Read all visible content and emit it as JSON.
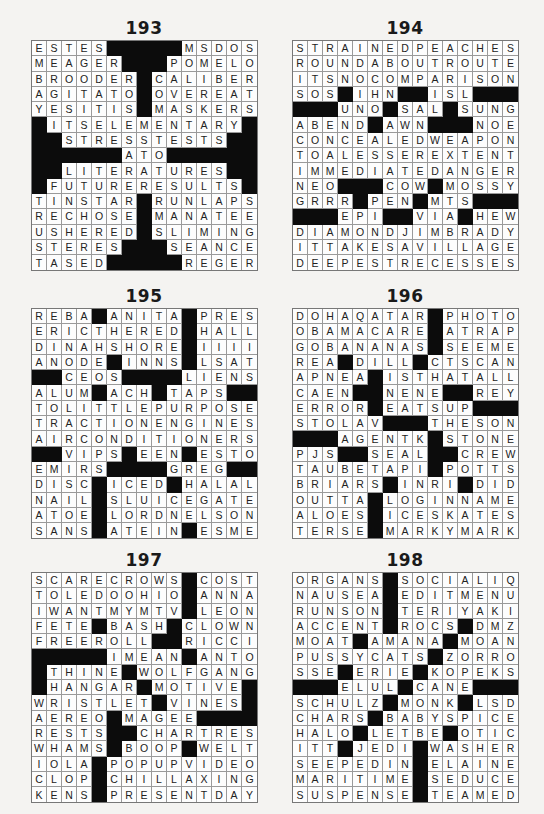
{
  "puzzles": [
    {
      "id": "p193",
      "title": "193",
      "rows": [
        "ESTES#####MSDOS",
        "MEAGER###POMELO",
        "BROODER#CALIBER",
        "AGITATO#OVEREAT",
        "YESITIS#MASKERS",
        "#ITSELEMENTARY#",
        "##STRESSTESTS##",
        "######ATO######",
        "##LITERATURES##",
        "#FUTURERESULTS#",
        "TINSTAR#RUNLAPS",
        "RECHOSE#MANATEE",
        "USHERED#SLIMING",
        "STERES###SEANCE",
        "TASED#####REGER"
      ]
    },
    {
      "id": "p194",
      "title": "194",
      "rows": [
        "STRAINEDPEACHES",
        "ROUNDABOUTROUTE",
        "ITSNOCOMPARISON",
        "SOS#IHN##ISL###",
        "###UNO#SAL#SUNG",
        "ABEND#AWN###NOE",
        "CONCEALEDWEAPON",
        "TOALESSEREXTENT",
        "IMMEDIATEDANGER",
        "NEO###COW#MOSSY",
        "GRRR#PEN#MTS###",
        "###EPI##VIA#HEW",
        "DIAMONDJIMBRADY",
        "ITTAKESAVILLAGE",
        "DEEPESTRECESSES"
      ]
    },
    {
      "id": "p195",
      "title": "195",
      "rows": [
        "REBA#ANITA#PRES",
        "ERICTHERED#HALL",
        "DINAHSHORE#IIII",
        "ANODE#INNS#LSAT",
        "##CEOS####LIENS",
        "ALUM#ACH#TAPS##",
        "TOLITTLEPURPOSE",
        "TRACTIONENGINES",
        "AIRCONDITIONERS",
        "##VIPS#EEN#ESTO",
        "EMIRS####GREG##",
        "DISC#ICED#HALAL",
        "NAIL#SLUICEGATE",
        "ATOE#LORDNELSON",
        "SANS#ATEIN#ESME"
      ]
    },
    {
      "id": "p196",
      "title": "196",
      "rows": [
        "DOHAQATAR#PHOTO",
        "OBAMACARE#ATRAP",
        "GOBANANAS#SEEME",
        "REA#DILL#CTSCAN",
        "APNEA#ISTHATALL",
        "CAEN##NENE##REY",
        "ERROR#EATSUP###",
        "STOLAV###THESON",
        "###AGENTK#STONE",
        "PJS##SEAL##CREW",
        "TAUBETAPI#POTTS",
        "BRIARS#INRI#DID",
        "OUTTA#LOGINNAME",
        "ALOES#ICESKATES",
        "TERSE#MARKYMARK"
      ]
    },
    {
      "id": "p197",
      "title": "197",
      "rows": [
        "SCARECROWS#COST",
        "TOLEDOOHIO#ANNA",
        "IWANTMYMTV#LEON",
        "FETE#BASH#CLOWN",
        "FREEROLL##RICCI",
        "#####IMEAN#ANTON",
        "#THINE#WOLFGANG",
        "#HANGAR#MOTIVE#",
        "WRISTLET#VINES#",
        "AEREO#MAGEE####",
        "RESTS##CHARTRES",
        "WHAMS#BOOP#WELT",
        "IOLA#POPUPVIDEO",
        "CLOP#CHILLAXING",
        "KENS#PRESENTDAY"
      ]
    },
    {
      "id": "p198",
      "title": "198",
      "rows": [
        "ORGANS#SOCIALIQ",
        "NAUSEA#EDITMENU",
        "RUNSON#TERIYAKI",
        "ACCENT#ROCS#DMZ",
        "MOAT#AMANA#MOAN",
        "PUSSYCATS#ZORRO",
        "SSE#ERIE#KOPEKS",
        "###ELUL#CANE###",
        "SCHULZ#MONK#LSD",
        "CHARS#BABYSPICE",
        "HALO#LETBE#OTIC",
        "ITT#JEDI#WASHER",
        "SEEPEDIN#ELAINE",
        "MARITIME#SEDUCE",
        "SUSPENSE#TEAMED"
      ]
    }
  ]
}
